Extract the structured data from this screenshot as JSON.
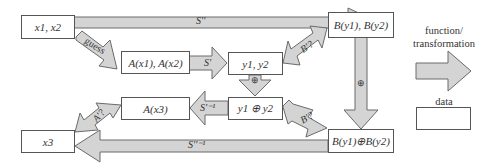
{
  "diagram": {
    "nodes": {
      "x1x2": "x1, x2",
      "Ax1Ax2": "A(x1), A(x2)",
      "y1y2": "y1, y2",
      "By1By2": "B(y1), B(y2)",
      "y1xory2": "y1 ⊕ y2",
      "Ax3": "A(x3)",
      "x3": "x3",
      "By1xorBy2": "B(y1)⊕B(y2)"
    },
    "edges": {
      "S_double": "S''",
      "guess": "guess",
      "S_prime": "S'",
      "B_q_top": "B'?",
      "xor_small": "⊕",
      "xor_big": "⊕",
      "S_prime_inv": "S'⁻¹",
      "B_q_bottom": "B'?",
      "A_q": "A'?",
      "S_double_inv": "S''⁻¹"
    }
  },
  "legend": {
    "function_label": "function/\ntransformation",
    "data_label": "data"
  },
  "colors": {
    "arrow_fill": "#d4d4d4",
    "arrow_stroke": "#6a6a6a",
    "box_border": "#555555"
  }
}
